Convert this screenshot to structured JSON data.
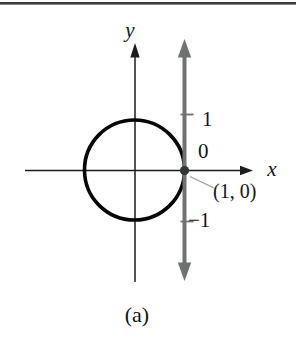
{
  "figure": {
    "type": "unit-circle-with-vertical-number-line",
    "caption": "(a)",
    "axes": {
      "x_label": "x",
      "y_label": "y"
    },
    "number_line": {
      "position_x": 1,
      "tick_labels": {
        "one": "1",
        "zero": "0",
        "neg_one": "−1"
      }
    },
    "point": {
      "label": "(1, 0)",
      "coords": [
        1,
        0
      ]
    },
    "circle": {
      "center": [
        0,
        0
      ],
      "radius": 1
    },
    "colors": {
      "axis": "#1c1c1c",
      "circle": "#060606",
      "number_line": "#6e7272",
      "point_dot": "#333636",
      "leader_line": "#9a9a9a",
      "top_rule": "#3e3e3e"
    }
  }
}
